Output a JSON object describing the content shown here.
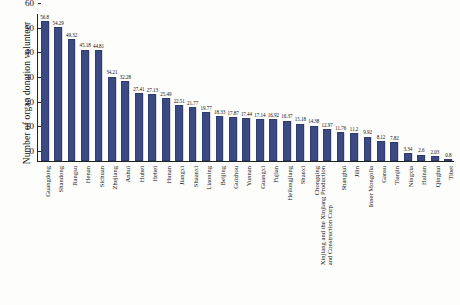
{
  "chart_data": {
    "type": "bar",
    "title": "",
    "xlabel": "",
    "ylabel": "Number of organ donation volunteer",
    "ylim": [
      0,
      60
    ],
    "yticks": [
      0,
      10,
      20,
      30,
      40,
      50,
      60
    ],
    "grid": false,
    "legend": null,
    "bar_color": "#3c4a83",
    "categories": [
      "Guangdong",
      "Shandong",
      "Jiangsu",
      "Henan",
      "Sichuan",
      "Zhejiang",
      "Anhui",
      "Hubei",
      "Hebei",
      "Hunan",
      "Jiangxi",
      "Shaanxi",
      "Liaoning",
      "Beijing",
      "Guizhou",
      "Yunnan",
      "Guangxi",
      "Fujian",
      "Heilongjiang",
      "Shanxi",
      "Chongqing",
      "Xinjiang and the Xinjiang Production and Construction Corp",
      "Shanghai",
      "Jilin",
      "Inner Mongolia",
      "Gansu",
      "Tianjin",
      "Ningxia",
      "Hainan",
      "Qinghai",
      "Tibet"
    ],
    "category_lines": [
      [
        "Guangdong"
      ],
      [
        "Shandong"
      ],
      [
        "Jiangsu"
      ],
      [
        "Henan"
      ],
      [
        "Sichuan"
      ],
      [
        "Zhejiang"
      ],
      [
        "Anhui"
      ],
      [
        "Hubei"
      ],
      [
        "Hebei"
      ],
      [
        "Hunan"
      ],
      [
        "Jiangxi"
      ],
      [
        "Shaanxi"
      ],
      [
        "Liaoning"
      ],
      [
        "Beijing"
      ],
      [
        "Guizhou"
      ],
      [
        "Yunnan"
      ],
      [
        "Guangxi"
      ],
      [
        "Fujian"
      ],
      [
        "Heilongjiang"
      ],
      [
        "Shanxi"
      ],
      [
        "Chongqing"
      ],
      [
        "Xinjiang and the Xinjiang Production",
        "and Construction Corp"
      ],
      [
        "Shanghai"
      ],
      [
        "Jilin"
      ],
      [
        "Inner Mongolia"
      ],
      [
        "Gansu"
      ],
      [
        "Tianjin"
      ],
      [
        "Ningxia"
      ],
      [
        "Hainan"
      ],
      [
        "Qinghai"
      ],
      [
        "Tibet"
      ]
    ],
    "values": [
      56.8,
      54.29,
      49.32,
      45.18,
      44.81,
      34.21,
      32.28,
      27.41,
      27.13,
      25.49,
      22.51,
      21.77,
      19.77,
      18.33,
      17.87,
      17.44,
      17.14,
      16.92,
      16.37,
      15.18,
      14.38,
      12.97,
      11.76,
      11.2,
      9.92,
      8.12,
      7.82,
      3.34,
      2.6,
      2.03,
      0.8
    ],
    "value_labels": [
      "56.8",
      "54.29",
      "49.32",
      "45.18",
      "44.81",
      "34.21",
      "32.28",
      "27.41",
      "27.13",
      "25.49",
      "22.51",
      "21.77",
      "19.77",
      "18.33",
      "17.87",
      "17.44",
      "17.14",
      "16.92",
      "16.37",
      "15.18",
      "14.38",
      "12.97",
      "11.76",
      "11.2",
      "9.92",
      "8.12",
      "7.82",
      "3.34",
      "2.6",
      "2.03",
      "0.8"
    ]
  }
}
